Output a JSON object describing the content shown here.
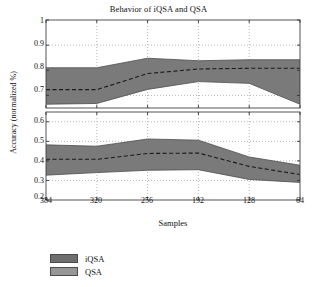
{
  "chart_data": {
    "type": "area",
    "title": "Behavior of iQSA and QSA",
    "xlabel": "Samples",
    "ylabel": "Accuracy (normalized %)",
    "x": [
      384,
      320,
      256,
      192,
      128,
      64
    ],
    "xticklabels": [
      "384",
      "320",
      "256",
      "192",
      "128",
      "64"
    ],
    "grid": true,
    "legend_position": "below-axes",
    "subplots": [
      {
        "name": "iQSA",
        "ylim": [
          0.65,
          1.0
        ],
        "yticks": [
          0.7,
          0.8,
          0.9,
          1
        ],
        "yticklabels": [
          "0.7",
          "0.8",
          "0.9",
          "1"
        ],
        "mean": [
          0.723,
          0.723,
          0.787,
          0.805,
          0.808,
          0.808
        ],
        "upper": [
          0.81,
          0.81,
          0.848,
          0.838,
          0.842,
          0.842
        ],
        "lower": [
          0.665,
          0.668,
          0.724,
          0.755,
          0.748,
          0.665
        ]
      },
      {
        "name": "QSA",
        "ylim": [
          0.2,
          0.65
        ],
        "yticks": [
          0.2,
          0.3,
          0.4,
          0.5,
          0.6
        ],
        "yticklabels": [
          "0.2",
          "0.3",
          "0.4",
          "0.5",
          "0.6"
        ],
        "mean": [
          0.408,
          0.408,
          0.438,
          0.44,
          0.372,
          0.33
        ],
        "upper": [
          0.482,
          0.475,
          0.512,
          0.506,
          0.42,
          0.378
        ],
        "lower": [
          0.327,
          0.34,
          0.352,
          0.355,
          0.305,
          0.29
        ]
      }
    ],
    "series": [
      {
        "name": "iQSA",
        "color": "#7a7a7a"
      },
      {
        "name": "QSA",
        "color": "#8c8c8c"
      }
    ],
    "legend": [
      {
        "label": "iQSA",
        "color": "#6e6e6e"
      },
      {
        "label": "QSA",
        "color": "#969696"
      }
    ]
  }
}
